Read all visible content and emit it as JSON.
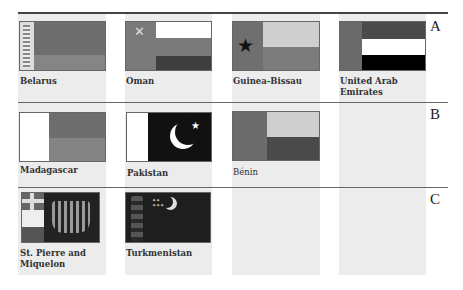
{
  "sections": [
    {
      "letter": "A",
      "flags": [
        {
          "name": "Belarus"
        },
        {
          "name": "Oman"
        },
        {
          "name": "Guinea-Bissau"
        },
        {
          "name": "United Arab Emirates",
          "label_line1": "United Arab",
          "label_line2": "Emirates"
        }
      ]
    },
    {
      "letter": "B",
      "flags": [
        {
          "name": "Madagascar"
        },
        {
          "name": "Pakistan"
        },
        {
          "name": "Bénin"
        }
      ]
    },
    {
      "letter": "C",
      "flags": [
        {
          "name": "St. Pierre and Miquelon",
          "label_line1": "St. Pierre and",
          "label_line2": "Miquelon"
        },
        {
          "name": "Turkmenistan"
        }
      ]
    }
  ],
  "colors": {
    "column_bg": "#ececec",
    "rule": "#444444",
    "medium_gray": "#7a7a7a",
    "dark_gray": "#3e3e3e",
    "light_gray": "#cfcfcf",
    "black": "#111111",
    "white": "#ffffff"
  }
}
